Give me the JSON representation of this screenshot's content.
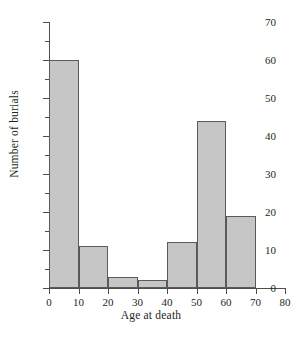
{
  "chart_data": {
    "type": "bar",
    "title": "",
    "xlabel": "Age at death",
    "ylabel": "Number of burials",
    "xlim": [
      0,
      80
    ],
    "ylim": [
      0,
      70
    ],
    "grid": false,
    "legend": null,
    "bin_width": 10,
    "bin_edges": [
      0,
      10,
      20,
      30,
      40,
      50,
      60,
      70
    ],
    "categories": [
      "0-10",
      "10-20",
      "20-30",
      "30-40",
      "40-50",
      "50-60",
      "60-70"
    ],
    "values": [
      60,
      11,
      3,
      2,
      12,
      44,
      19
    ],
    "bars": [
      {
        "label": "0-10",
        "start": 0,
        "end": 10,
        "value": 60
      },
      {
        "label": "10-20",
        "start": 10,
        "end": 20,
        "value": 11
      },
      {
        "label": "20-30",
        "start": 20,
        "end": 30,
        "value": 3
      },
      {
        "label": "30-40",
        "start": 30,
        "end": 40,
        "value": 2
      },
      {
        "label": "40-50",
        "start": 40,
        "end": 50,
        "value": 12
      },
      {
        "label": "50-60",
        "start": 50,
        "end": 60,
        "value": 44
      },
      {
        "label": "60-70",
        "start": 60,
        "end": 70,
        "value": 19
      }
    ],
    "x_ticks": [
      {
        "value": 0,
        "label": "0"
      },
      {
        "value": 10,
        "label": "10"
      },
      {
        "value": 20,
        "label": "20"
      },
      {
        "value": 30,
        "label": "30"
      },
      {
        "value": 40,
        "label": "40"
      },
      {
        "value": 50,
        "label": "50"
      },
      {
        "value": 60,
        "label": "60"
      },
      {
        "value": 70,
        "label": "70"
      },
      {
        "value": 80,
        "label": "80"
      }
    ],
    "y_ticks_major": [
      {
        "value": 0,
        "label": "0"
      },
      {
        "value": 10,
        "label": "10"
      },
      {
        "value": 20,
        "label": "20"
      },
      {
        "value": 30,
        "label": "30"
      },
      {
        "value": 40,
        "label": "40"
      },
      {
        "value": 50,
        "label": "50"
      },
      {
        "value": 60,
        "label": "60"
      },
      {
        "value": 70,
        "label": "70"
      }
    ],
    "y_ticks_minor": [
      5,
      15,
      25,
      35,
      45,
      55,
      65
    ],
    "colors": {
      "bar_fill": "#c6c6c6",
      "bar_stroke": "#5a5a5a",
      "axis": "#4d4d4d",
      "text": "#231f20",
      "background": "#ffffff"
    }
  }
}
